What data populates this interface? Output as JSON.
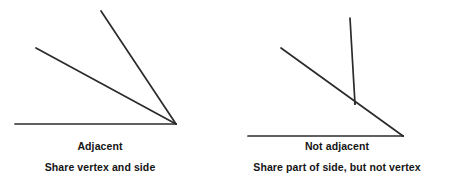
{
  "figure": {
    "background_color": "#ffffff",
    "line_color": "#2b2b2b",
    "text_color": "#141414",
    "panels": [
      {
        "id": "left",
        "caption_title": "Adjacent",
        "caption_subtitle": "Share vertex and side",
        "vertex_label": "shared vertex",
        "geometry": {
          "vertex": [
            176,
            124
          ],
          "rays": [
            {
              "name": "horizontal-ray",
              "from": [
                176,
                124
              ],
              "to": [
                15,
                124
              ]
            },
            {
              "name": "middle-ray",
              "from": [
                176,
                124
              ],
              "to": [
                36,
                48
              ]
            },
            {
              "name": "steep-ray",
              "from": [
                176,
                124
              ],
              "to": [
                101,
                11
              ]
            }
          ]
        }
      },
      {
        "id": "right",
        "caption_title": "Not adjacent",
        "caption_subtitle": "Share part of side, but not vertex",
        "vertex_label": "separate vertices",
        "geometry": {
          "vertex": [
            403,
            136
          ],
          "intersection": [
            355,
            104
          ],
          "rays": [
            {
              "name": "horizontal-ray",
              "from": [
                403,
                136
              ],
              "to": [
                248,
                136
              ]
            },
            {
              "name": "diagonal-ray",
              "from": [
                403,
                136
              ],
              "to": [
                281,
                48
              ]
            },
            {
              "name": "vertical-ray",
              "from": [
                355,
                104
              ],
              "to": [
                350,
                18
              ]
            }
          ]
        }
      }
    ]
  }
}
